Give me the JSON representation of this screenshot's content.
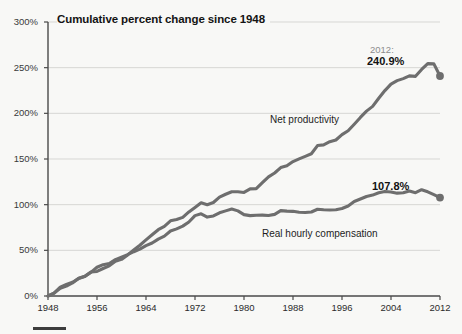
{
  "chart_data": {
    "type": "line",
    "title": "Cumulative percent change since 1948",
    "xlabel": "",
    "ylabel": "",
    "xlim": [
      1948,
      2012
    ],
    "ylim": [
      0,
      300
    ],
    "grid": true,
    "legend": "inline-labels",
    "xticks": [
      1948,
      1956,
      1964,
      1972,
      1980,
      1988,
      1996,
      2004,
      2012
    ],
    "xtick_labels": [
      "1948",
      "1956",
      "1964",
      "1972",
      "1980",
      "1988",
      "1996",
      "2004",
      "2012"
    ],
    "yticks": [
      0,
      50,
      100,
      150,
      200,
      250,
      300
    ],
    "ytick_labels": [
      "0%",
      "50%",
      "100%",
      "150%",
      "200%",
      "250%",
      "300%"
    ],
    "line_color": "#6e6e6e",
    "grid_color": "#d7d7d4",
    "axis_color": "#4a4a4a",
    "background": "#f8f8f6",
    "annotations": [
      {
        "name": "endpoint-year",
        "text": "2012:"
      },
      {
        "name": "endpoint-value-top",
        "text": "240.9%"
      },
      {
        "name": "endpoint-value-bottom",
        "text": "107.8%"
      }
    ],
    "series": [
      {
        "name": "Net productivity",
        "label": "Net productivity",
        "end_value": 240.9,
        "end_label": "240.9%",
        "x": [
          1948,
          1949,
          1950,
          1951,
          1952,
          1953,
          1954,
          1955,
          1956,
          1957,
          1958,
          1959,
          1960,
          1961,
          1962,
          1963,
          1964,
          1965,
          1966,
          1967,
          1968,
          1969,
          1970,
          1971,
          1972,
          1973,
          1974,
          1975,
          1976,
          1977,
          1978,
          1979,
          1980,
          1981,
          1982,
          1983,
          1984,
          1985,
          1986,
          1987,
          1988,
          1989,
          1990,
          1991,
          1992,
          1993,
          1994,
          1995,
          1996,
          1997,
          1998,
          1999,
          2000,
          2001,
          2002,
          2003,
          2004,
          2005,
          2006,
          2007,
          2008,
          2009,
          2010,
          2011,
          2012
        ],
        "values": [
          0,
          3.1,
          9.7,
          12.6,
          15.1,
          19.1,
          21.3,
          26.2,
          26.9,
          30.1,
          33.0,
          38.1,
          40.1,
          45.0,
          50.4,
          55.6,
          61.4,
          67.1,
          72.6,
          76.3,
          82.3,
          83.7,
          86.1,
          92.1,
          97.0,
          102.1,
          100.0,
          102.4,
          108.3,
          111.4,
          114.2,
          114.2,
          113.4,
          117.3,
          117.5,
          124.1,
          130.4,
          134.7,
          140.6,
          142.5,
          147.2,
          150.1,
          152.9,
          155.7,
          164.7,
          165.5,
          168.9,
          170.8,
          176.7,
          181.0,
          188.1,
          195.5,
          202.4,
          207.6,
          216.5,
          224.9,
          232.0,
          235.8,
          238.0,
          241.0,
          240.5,
          248.0,
          254.4,
          254.2,
          240.9
        ]
      },
      {
        "name": "Real hourly compensation",
        "label": "Real hourly compensation",
        "end_value": 107.8,
        "end_label": "107.8%",
        "x": [
          1948,
          1949,
          1950,
          1951,
          1952,
          1953,
          1954,
          1955,
          1956,
          1957,
          1958,
          1959,
          1960,
          1961,
          1962,
          1963,
          1964,
          1965,
          1966,
          1967,
          1968,
          1969,
          1970,
          1971,
          1972,
          1973,
          1974,
          1975,
          1976,
          1977,
          1978,
          1979,
          1980,
          1981,
          1982,
          1983,
          1984,
          1985,
          1986,
          1987,
          1988,
          1989,
          1990,
          1991,
          1992,
          1993,
          1994,
          1995,
          1996,
          1997,
          1998,
          1999,
          2000,
          2001,
          2002,
          2003,
          2004,
          2005,
          2006,
          2007,
          2008,
          2009,
          2010,
          2011,
          2012
        ],
        "values": [
          0,
          3.2,
          8.5,
          10.9,
          14.3,
          19.5,
          21.5,
          25.9,
          31.5,
          34.3,
          35.6,
          39.8,
          42.5,
          45.2,
          48.5,
          51.3,
          55.1,
          58.0,
          62.3,
          65.6,
          71.2,
          73.5,
          76.5,
          81.0,
          88.0,
          90.0,
          86.4,
          87.6,
          91.1,
          93.2,
          95.2,
          93.2,
          89.1,
          88.0,
          88.4,
          88.6,
          88.2,
          89.4,
          93.5,
          92.9,
          92.7,
          91.7,
          91.4,
          92.0,
          95.0,
          94.5,
          94.2,
          94.5,
          95.8,
          98.5,
          103.5,
          106.2,
          109.0,
          110.5,
          113.0,
          114.5,
          113.9,
          112.6,
          113.0,
          115.0,
          113.1,
          116.4,
          114.1,
          111.0,
          107.8
        ]
      }
    ]
  }
}
